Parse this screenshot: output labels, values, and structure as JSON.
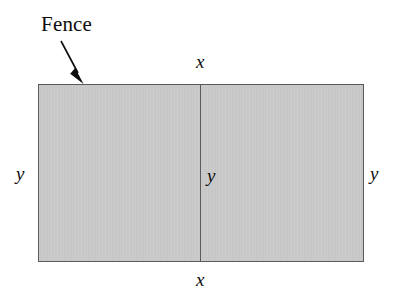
{
  "figure": {
    "kind": "geometry-diagram",
    "title_label": "Fence",
    "background_color": "#ffffff",
    "rectangle": {
      "fill_color": "#c9c9c9",
      "stroke_color": "#5a5a5a",
      "x": 38,
      "y": 84,
      "width": 326,
      "height": 178
    },
    "divider": {
      "stroke_color": "#5a5a5a",
      "x": 200,
      "y_top": 84,
      "y_bottom": 262
    },
    "annotation": {
      "text": "Fence",
      "arrow": {
        "from_x": 62,
        "from_y": 42,
        "to_x": 82,
        "to_y": 82,
        "color": "#0d0d0d"
      }
    },
    "labels": {
      "x_top": "x",
      "x_bottom": "x",
      "y_left": "y",
      "y_middle": "y",
      "y_right": "y"
    }
  }
}
